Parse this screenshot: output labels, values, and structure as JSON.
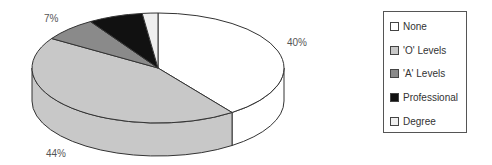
{
  "chart_data": {
    "type": "pie",
    "style": "3d",
    "title": "",
    "categories": [
      "None",
      "'O' Levels",
      "'A' Levels",
      "Professional",
      "Degree"
    ],
    "values": [
      40,
      44,
      7,
      7,
      2
    ],
    "colors": [
      "#ffffff",
      "#c8c8c8",
      "#8a8a8a",
      "#111111",
      "#efefef"
    ],
    "data_labels": [
      {
        "text": "40%",
        "category": "None"
      },
      {
        "text": "44%",
        "category": "'O' Levels"
      },
      {
        "text": "7%",
        "category": "'A' Levels"
      }
    ],
    "legend_position": "right"
  },
  "labels": {
    "none_pct": "40%",
    "olevels_pct": "44%",
    "alevels_pct": "7%"
  },
  "legend": {
    "items": [
      {
        "label": "None",
        "color": "#ffffff"
      },
      {
        "label": "'O' Levels",
        "color": "#c8c8c8"
      },
      {
        "label": "'A' Levels",
        "color": "#8a8a8a"
      },
      {
        "label": "Professional",
        "color": "#111111"
      },
      {
        "label": "Degree",
        "color": "#efefef"
      }
    ]
  }
}
